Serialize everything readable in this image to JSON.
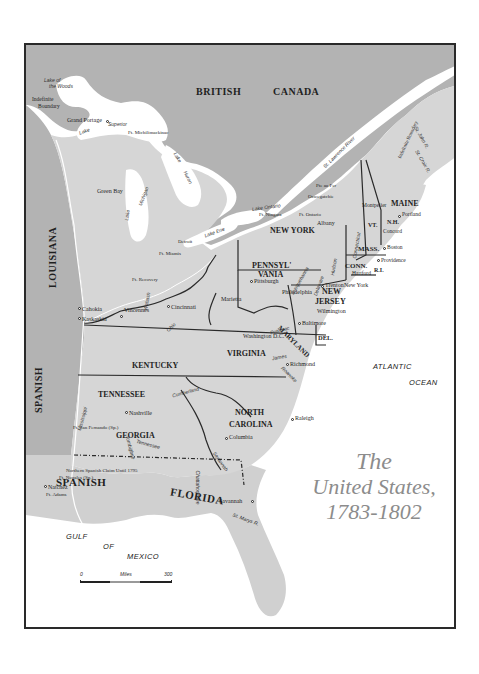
{
  "title": {
    "line1": "The",
    "line2": "United States,",
    "line3": "1783-1802"
  },
  "countries": {
    "british": "BRITISH",
    "canada": "CANADA",
    "louisiana": "LOUISIANA",
    "spanish_west": "SPANISH",
    "spanish_south": "SPANISH",
    "florida": "FLORIDA"
  },
  "states": {
    "maine": "MAINE",
    "vt": "VT.",
    "nh": "N.H.",
    "mass": "MASS.",
    "conn": "CONN.",
    "ri": "R.I.",
    "new_york": "NEW YORK",
    "penn_1": "PENNSYL'",
    "penn_2": "VANIA",
    "new_jersey_1": "NEW",
    "new_jersey_2": "JERSEY",
    "maryland": "MARYLAND",
    "del": "DEL.",
    "virginia": "VIRGINIA",
    "kentucky": "KENTUCKY",
    "tennessee": "TENNESSEE",
    "north_carolina_1": "NORTH",
    "north_carolina_2": "CAROLINA",
    "georgia": "GEORGIA"
  },
  "cities": {
    "grand_portage": "Grand Portage",
    "ft_michilimackinac": "Ft. Michilimackinac",
    "green_bay": "Green Bay",
    "detroit": "Detroit",
    "ft_miamis": "Ft. Miamis",
    "ft_recovery": "Ft. Recovery",
    "cahokia": "Cahokia",
    "kaskaskia": "Kaskaskia",
    "vincennes": "Vincennes",
    "cincinnati": "Cincinnati",
    "marietta": "Marietta",
    "pittsburgh": "Pittsburgh",
    "philadelphia": "Philadelphia",
    "trenton": "Trenton",
    "wilmington": "Wilmington",
    "baltimore": "Baltimore",
    "washington": "Washington D.C.",
    "richmond": "Richmond",
    "raleigh": "Raleigh",
    "columbia": "Columbia",
    "savannah": "Savannah",
    "nashville": "Nashville",
    "ft_san_fernando": "Ft. San Fernando (Sp.)",
    "ft_nogales": "Ft. Nogales (Sp.)",
    "natchez": "Natchez",
    "ft_adams": "Ft. Adams",
    "new_york_city": "New York",
    "hartford": "Hartford",
    "providence": "Providence",
    "boston": "Boston",
    "concord": "Concord",
    "montpelier": "Montpelier",
    "portland": "Portland",
    "albany": "Albany",
    "oswegatchie": "Oswegatchie",
    "pte_au_fer": "Pte au Fer",
    "ft_niagara": "Ft. Niagara",
    "ft_ontario": "Ft. Ontario"
  },
  "water": {
    "lake_of_the_woods_1": "Lake of",
    "lake_of_the_woods_2": "the Woods",
    "lake_superior_1": "Lake",
    "lake_superior_2": "Superior",
    "lake_michigan_1": "Lake",
    "lake_michigan_2": "Michigan",
    "lake_huron_1": "Lake",
    "lake_huron_2": "Huron",
    "lake_erie": "Lake Erie",
    "lake_ontario": "Lake Ontario",
    "st_lawrence": "St. Lawrence River",
    "st_john": "St. John R.",
    "st_croix": "St. Croix R.",
    "connecticut": "Connecticut",
    "hudson": "Hudson",
    "delaware": "Delaware",
    "susquehanna": "Susquehanna",
    "potomac": "Potomac",
    "james": "James",
    "roanoke": "Roanoke",
    "ohio": "Ohio",
    "wabash": "Wabash",
    "cumberland": "Cumberland",
    "tennessee_r": "Tennessee",
    "mississippi": "Mississippi",
    "tombigbee": "Tombigbee",
    "chattahoochee": "Chattahoochee",
    "savannah_r": "Savannah",
    "st_marys": "St. Marys R.",
    "river_abbr": "R.",
    "atlantic": "ATLANTIC",
    "ocean": "OCEAN",
    "gulf": "GULF",
    "of": "OF",
    "mexico": "MEXICO"
  },
  "annotations": {
    "indefinite_boundary_w_1": "Indefinite",
    "indefinite_boundary_w_2": "Boundary",
    "indefinite_boundary_ne": "Indefinite Boundary",
    "northern_spanish_claim": "Northern Spanish Claim Until 1795"
  },
  "scale": {
    "start": "0",
    "unit": "Miles",
    "end": "300"
  },
  "colors": {
    "foreign_land": "#b3b3b3",
    "us_land": "#d6d6d6",
    "water": "#ffffff",
    "border": "#2a2a2a",
    "title": "#8c8c8c"
  }
}
